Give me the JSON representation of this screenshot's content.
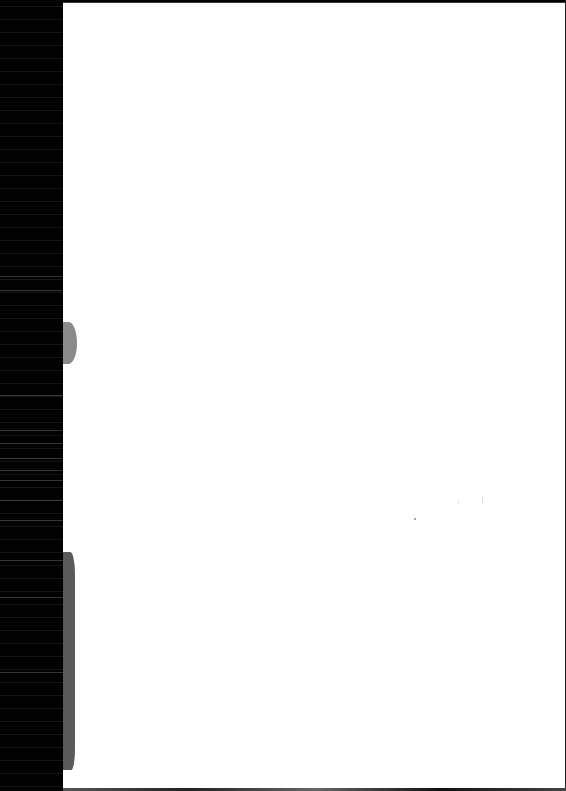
{
  "document": {
    "type": "scanned-page",
    "content": "",
    "margin_color": "#000000",
    "page_color": "#ffffff",
    "artifacts": {
      "left_margin_width_px": 63,
      "smudges": [
        {
          "y_start": 322,
          "y_end": 364,
          "color": "#8a8a8a"
        },
        {
          "y_start": 552,
          "y_end": 770,
          "color": "#5a5a5a"
        }
      ]
    }
  }
}
